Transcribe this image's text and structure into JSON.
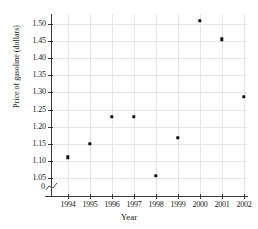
{
  "chart_data": {
    "type": "scatter",
    "title": "",
    "xlabel": "Year",
    "ylabel": "Price of gasoline (dollars)",
    "x": [
      1994,
      1995,
      1996,
      1997,
      1998,
      1999,
      2000,
      2001,
      2002
    ],
    "values": [
      1.11,
      1.15,
      1.229,
      1.229,
      1.057,
      1.168,
      1.51,
      1.455,
      1.287
    ],
    "xtick_labels": [
      "1994",
      "1995",
      "1996",
      "1997",
      "1998",
      "1999",
      "2000",
      "2001",
      "2002"
    ],
    "ytick_labels": [
      "1.05",
      "1.10",
      "1.15",
      "1.20",
      "1.25",
      "1.30",
      "1.35",
      "1.40",
      "1.45",
      "1.50"
    ],
    "ytick_values": [
      1.05,
      1.1,
      1.15,
      1.2,
      1.25,
      1.3,
      1.35,
      1.4,
      1.45,
      1.5
    ],
    "ylim": [
      1.05,
      1.52
    ],
    "xlim": [
      1993.5,
      2002.5
    ],
    "grid": true,
    "legend": "none",
    "axis_break": true,
    "origin_label": "0",
    "marker_color": "#111111",
    "grid_color": "#e6e6e6",
    "axis_color": "#3a3a3a"
  }
}
